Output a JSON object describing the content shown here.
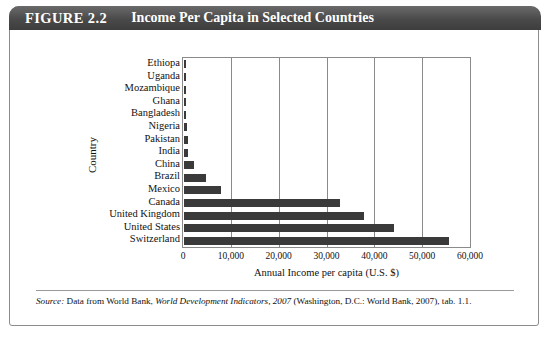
{
  "figure": {
    "label": "FIGURE 2.2",
    "title": "Income Per Capita in Selected Countries"
  },
  "source": {
    "prefix": "Source:",
    "text_before": "Data from World Bank,",
    "italic": "World Development Indicators, 2007",
    "text_after": "(Washington, D.C.: World Bank, 2007), tab. 1.1."
  },
  "chart_data": {
    "type": "bar",
    "orientation": "horizontal",
    "title": "Income Per Capita in Selected Countries",
    "xlabel": "Annual Income per capita (U.S. $)",
    "ylabel": "Country",
    "xlim": [
      0,
      60000
    ],
    "xticks": [
      0,
      10000,
      20000,
      30000,
      40000,
      50000,
      60000
    ],
    "xtick_labels": [
      "0",
      "10,000",
      "20,000",
      "30,000",
      "40,000",
      "50,000",
      "60,000"
    ],
    "grid": true,
    "legend": null,
    "bar_color": "#3a3a3a",
    "categories": [
      "Ethiopa",
      "Uganda",
      "Mozambique",
      "Ghana",
      "Bangladesh",
      "Nigeria",
      "Pakistan",
      "India",
      "China",
      "Brazil",
      "Mexico",
      "Canada",
      "United Kingdom",
      "United States",
      "Switzerland"
    ],
    "values": [
      180,
      300,
      340,
      520,
      480,
      640,
      770,
      820,
      2000,
      4700,
      7800,
      32600,
      37600,
      44000,
      55500
    ]
  }
}
